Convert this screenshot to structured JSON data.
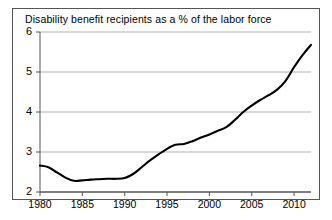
{
  "chart_data": {
    "type": "line",
    "title": "Disability benefit recipients as a % of the labor force",
    "xlabel": "",
    "ylabel": "",
    "xlim": [
      1980,
      2012
    ],
    "ylim": [
      2,
      6
    ],
    "grid": true,
    "legend": false,
    "legend_position": "none",
    "line_color": "#000000",
    "grid_color": "#b0b0b0",
    "axis_color": "#555555",
    "background_color": "#ffffff",
    "xticks": [
      1980,
      1985,
      1990,
      1995,
      2000,
      2005,
      2010
    ],
    "yticks": [
      2,
      3,
      4,
      5,
      6
    ],
    "series": [
      {
        "name": "Disability benefit recipients as a % of the labor force",
        "x": [
          1980,
          1981,
          1982,
          1983,
          1984,
          1985,
          1986,
          1987,
          1988,
          1989,
          1990,
          1991,
          1992,
          1993,
          1994,
          1995,
          1996,
          1997,
          1998,
          1999,
          2000,
          2001,
          2002,
          2003,
          2004,
          2005,
          2006,
          2007,
          2008,
          2009,
          2010,
          2011,
          2012
        ],
        "values": [
          2.66,
          2.62,
          2.49,
          2.36,
          2.28,
          2.29,
          2.31,
          2.32,
          2.33,
          2.33,
          2.35,
          2.45,
          2.62,
          2.79,
          2.94,
          3.08,
          3.18,
          3.2,
          3.27,
          3.36,
          3.44,
          3.53,
          3.62,
          3.8,
          4.0,
          4.16,
          4.3,
          4.42,
          4.56,
          4.78,
          5.12,
          5.42,
          5.68
        ]
      }
    ]
  },
  "axis": {
    "ytick_labels": [
      "6",
      "5",
      "4",
      "3",
      "2"
    ],
    "xtick_labels": [
      "1980",
      "1985",
      "1990",
      "1995",
      "2000",
      "2005",
      "2010"
    ]
  }
}
